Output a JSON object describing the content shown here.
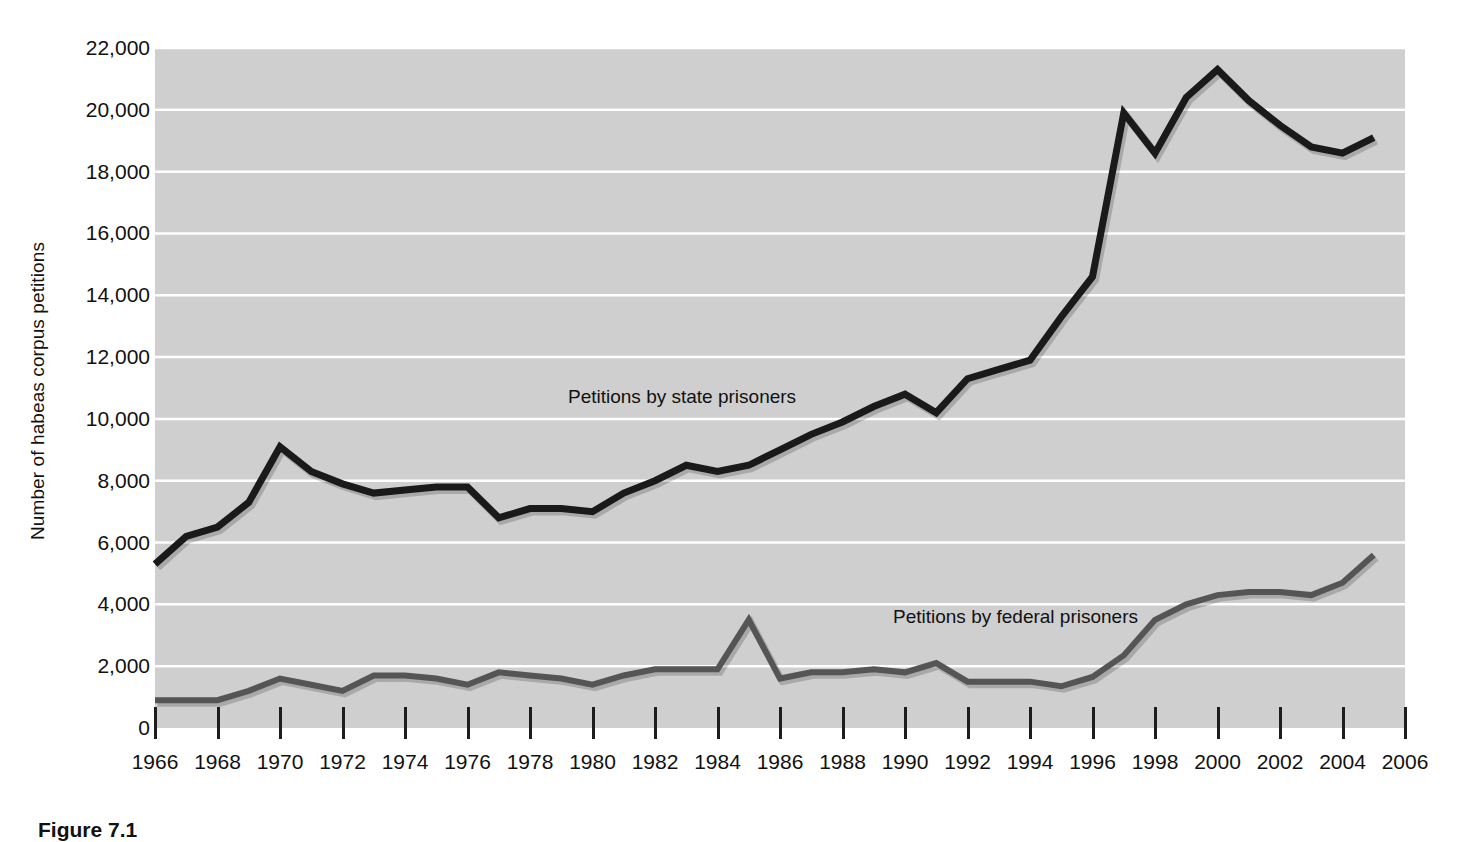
{
  "figure": {
    "caption": "Figure 7.1"
  },
  "axes": {
    "ylabel": "Number of habeas corpus petitions",
    "yticks": [
      "0",
      "2,000",
      "4,000",
      "6,000",
      "8,000",
      "10,000",
      "12,000",
      "14,000",
      "16,000",
      "18,000",
      "20,000",
      "22,000"
    ],
    "xticks": [
      "1966",
      "1968",
      "1970",
      "1972",
      "1974",
      "1976",
      "1978",
      "1980",
      "1982",
      "1984",
      "1986",
      "1988",
      "1990",
      "1992",
      "1994",
      "1996",
      "1998",
      "2000",
      "2002",
      "2004",
      "2006"
    ]
  },
  "annotations": {
    "state_label": "Petitions by state prisoners",
    "federal_label": "Petitions by federal prisoners"
  },
  "colors": {
    "plot_background": "#cfcfcf",
    "gridline": "#ffffff",
    "state_series": "#1a1a1a",
    "federal_series": "#555555",
    "text": "#111111"
  },
  "chart_data": {
    "type": "line",
    "title": "",
    "xlabel": "",
    "ylabel": "Number of habeas corpus petitions",
    "xlim": [
      1966,
      2006
    ],
    "ylim": [
      0,
      22000
    ],
    "ytick_step": 2000,
    "xtick_step": 2,
    "grid": "horizontal",
    "legend": "inline-labels",
    "x": [
      1966,
      1967,
      1968,
      1969,
      1970,
      1971,
      1972,
      1973,
      1974,
      1975,
      1976,
      1977,
      1978,
      1979,
      1980,
      1981,
      1982,
      1983,
      1984,
      1985,
      1986,
      1987,
      1988,
      1989,
      1990,
      1991,
      1992,
      1993,
      1994,
      1995,
      1996,
      1997,
      1998,
      1999,
      2000,
      2001,
      2002,
      2003,
      2004,
      2005
    ],
    "series": [
      {
        "name": "Petitions by state prisoners",
        "color": "#1a1a1a",
        "values": [
          5300,
          6200,
          6500,
          7300,
          9100,
          8300,
          7900,
          7600,
          7700,
          7800,
          7800,
          6800,
          7100,
          7100,
          7000,
          7600,
          8000,
          8500,
          8300,
          8500,
          9000,
          9500,
          9900,
          10400,
          10800,
          10200,
          11300,
          11600,
          11900,
          13300,
          14600,
          19900,
          18600,
          20400,
          21300,
          20300,
          19500,
          18800,
          18600,
          19100
        ]
      },
      {
        "name": "Petitions by federal prisoners",
        "color": "#555555",
        "values": [
          900,
          900,
          900,
          1200,
          1600,
          1400,
          1200,
          1700,
          1700,
          1600,
          1400,
          1800,
          1700,
          1600,
          1400,
          1700,
          1900,
          1900,
          1900,
          3500,
          1600,
          1800,
          1800,
          1900,
          1800,
          2100,
          1500,
          1500,
          1500,
          1350,
          1650,
          2350,
          3500,
          4000,
          4300,
          4400,
          4400,
          4300,
          4700,
          5600
        ]
      }
    ]
  }
}
